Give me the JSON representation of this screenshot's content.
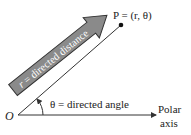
{
  "diagram": {
    "origin_label": "O",
    "point_label": "P = (r, θ)",
    "arrow_label": "r = directed distance",
    "angle_label": "θ = directed angle",
    "axis_label_line1": "Polar",
    "axis_label_line2": "axis",
    "colors": {
      "arrow_fill": "#8a8a8a",
      "arrow_stroke": "#333333",
      "line": "#333333",
      "text": "#222222"
    }
  }
}
